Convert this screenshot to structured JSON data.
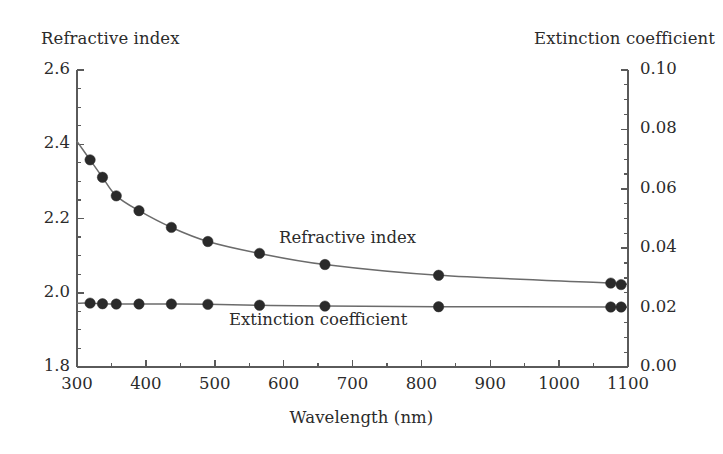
{
  "labels": {
    "left_axis_title": "Refractive index",
    "right_axis_title": "Extinction coefficient",
    "x_axis_title": "Wavelength (nm)",
    "annotation_n": "Refractive index",
    "annotation_k": "Extinction coefficient"
  },
  "colors": {
    "line": "#6b6b6b",
    "marker": "#2a2a2a",
    "axis": "#5a5a5a",
    "text": "#2b2b2b",
    "background": "#ffffff"
  },
  "chart_data": {
    "type": "scatter",
    "title": "",
    "xlabel": "Wavelength (nm)",
    "ylabel": "Refractive index",
    "y2label": "Extinction coefficient",
    "xlim": [
      300,
      1100
    ],
    "ylim": [
      1.8,
      2.6
    ],
    "y2lim": [
      0.0,
      0.1
    ],
    "grid": false,
    "legend_position": "inline-annotation",
    "x_ticks": [
      300,
      400,
      500,
      600,
      700,
      800,
      900,
      1000,
      1100
    ],
    "x_tick_labels": [
      "300",
      "400",
      "500",
      "600",
      "700",
      "800",
      "900",
      "1000",
      "1100"
    ],
    "x_minor_tick_step": 50,
    "y_ticks": [
      1.8,
      2.0,
      2.2,
      2.4,
      2.6
    ],
    "y_tick_labels": [
      "1.8",
      "2.0",
      "2.2",
      "2.4",
      "2.6"
    ],
    "y_minor_tick_step": 0.05,
    "y2_ticks": [
      0.0,
      0.02,
      0.04,
      0.06,
      0.08,
      0.1
    ],
    "y2_tick_labels": [
      "0.00",
      "0.02",
      "0.04",
      "0.06",
      "0.08",
      "0.10"
    ],
    "y2_minor_tick_step": 0.005,
    "series": [
      {
        "name": "Refractive index",
        "axis": "left",
        "marker": "filled-circle",
        "line": "solid",
        "x": [
          319,
          337,
          357,
          390,
          437,
          490,
          565,
          660,
          825,
          1075,
          1090
        ],
        "values": [
          2.358,
          2.311,
          2.261,
          2.221,
          2.176,
          2.138,
          2.106,
          2.076,
          2.047,
          2.026,
          2.022
        ]
      },
      {
        "name": "Extinction coefficient",
        "axis": "right",
        "marker": "filled-circle",
        "line": "solid",
        "x": [
          319,
          337,
          357,
          390,
          437,
          490,
          565,
          660,
          825,
          1075,
          1090
        ],
        "values": [
          0.0215,
          0.0213,
          0.0212,
          0.0212,
          0.0212,
          0.0211,
          0.0208,
          0.0205,
          0.0203,
          0.0202,
          0.0202
        ]
      }
    ]
  }
}
